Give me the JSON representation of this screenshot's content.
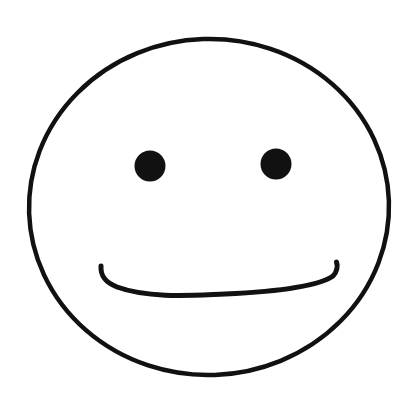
{
  "canvas": {
    "width": 411,
    "height": 404,
    "background_color": "#ffffff",
    "title": "Smiley Face Line Drawing",
    "description": "Hand-drawn black outline smiley face on a white background"
  },
  "drawing": {
    "ink_color": "#111111",
    "fill_color": "#ffffff",
    "style": "hand-drawn line art",
    "face": {
      "name": "face-outline",
      "shape": "ellipse",
      "center_x": 209,
      "center_y": 207,
      "radius_x": 180,
      "radius_y": 168,
      "stroke_width": 4.5,
      "stroke_color": "#111111",
      "fill": "#ffffff",
      "rotation_deg": -2,
      "bounds": {
        "left": 27,
        "top": 38,
        "right": 392,
        "bottom": 376
      }
    },
    "eyes": [
      {
        "name": "left-eye",
        "shape": "circle",
        "center_x": 150,
        "center_y": 166,
        "radius": 15.5,
        "fill": "#111111"
      },
      {
        "name": "right-eye",
        "shape": "circle",
        "center_x": 276,
        "center_y": 164,
        "radius": 15.5,
        "fill": "#111111"
      }
    ],
    "mouth": {
      "name": "mouth-smile",
      "shape": "open-curve",
      "expression": "smile",
      "start_x": 101,
      "start_y": 266,
      "end_x": 337,
      "end_y": 262,
      "lowest_y": 293,
      "stroke_width": 5,
      "stroke_color": "#111111",
      "path": "M 101 266 C 100.5 275 104 282 117 287 C 150 299 196 295 225 294 C 268 292 316 288 333 276 C 337 272 338 266 336.5 262"
    }
  }
}
